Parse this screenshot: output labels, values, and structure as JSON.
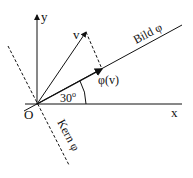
{
  "diagram": {
    "axes": {
      "x_label": "x",
      "y_label": "y",
      "origin_label": "O"
    },
    "vector_label": "v",
    "image_label": "φ(v)",
    "angle_label": "30",
    "angle_degree_mark": "o",
    "image_line_label": "Bild φ",
    "kernel_line_label": "Kern φ",
    "colors": {
      "ink": "#111111",
      "background": "#ffffff"
    }
  }
}
